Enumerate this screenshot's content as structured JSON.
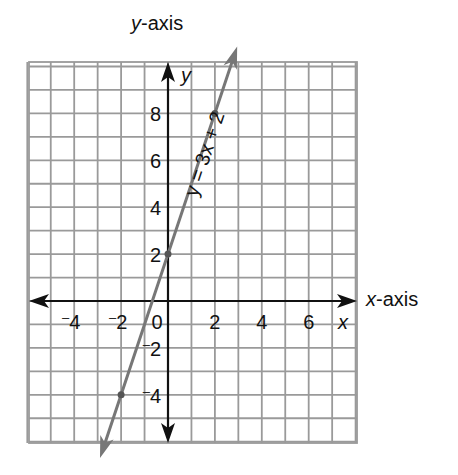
{
  "chart_data": {
    "type": "line",
    "title": "",
    "xlabel": "x-axis",
    "ylabel": "y-axis",
    "x_axis_var": "x",
    "y_axis_var": "y",
    "xlim": [
      -6,
      8
    ],
    "ylim": [
      -6,
      10
    ],
    "grid": true,
    "x_ticks": [
      {
        "value": -4,
        "label": "-4"
      },
      {
        "value": -2,
        "label": "-2"
      },
      {
        "value": 2,
        "label": "2"
      },
      {
        "value": 4,
        "label": "4"
      },
      {
        "value": 6,
        "label": "6"
      }
    ],
    "y_ticks": [
      {
        "value": 8,
        "label": "8"
      },
      {
        "value": 6,
        "label": "6"
      },
      {
        "value": 4,
        "label": "4"
      },
      {
        "value": 2,
        "label": "2"
      },
      {
        "value": -2,
        "label": "-2"
      },
      {
        "value": -4,
        "label": "-4"
      }
    ],
    "origin_label": "0",
    "series": [
      {
        "name": "y = 3x + 2",
        "equation": "y = 3x + 2",
        "slope": 3,
        "intercept": 2,
        "x_range": [
          -2.9,
          2.95
        ],
        "points": [
          {
            "x": -2,
            "y": -4
          },
          {
            "x": 0,
            "y": 2
          },
          {
            "x": 2,
            "y": 8
          }
        ]
      }
    ],
    "annotations": [
      {
        "text": "y = 3x + 2",
        "position": "along line, right side",
        "rotation": "parallel to line"
      }
    ]
  },
  "labels": {
    "y_axis_title_var": "y",
    "y_axis_title_rest": "-axis",
    "x_axis_title_var": "x",
    "x_axis_title_rest": "-axis"
  },
  "colors": {
    "grid": "#9a9a9a",
    "axis": "#111111",
    "line": "#777777",
    "text": "#111111"
  }
}
